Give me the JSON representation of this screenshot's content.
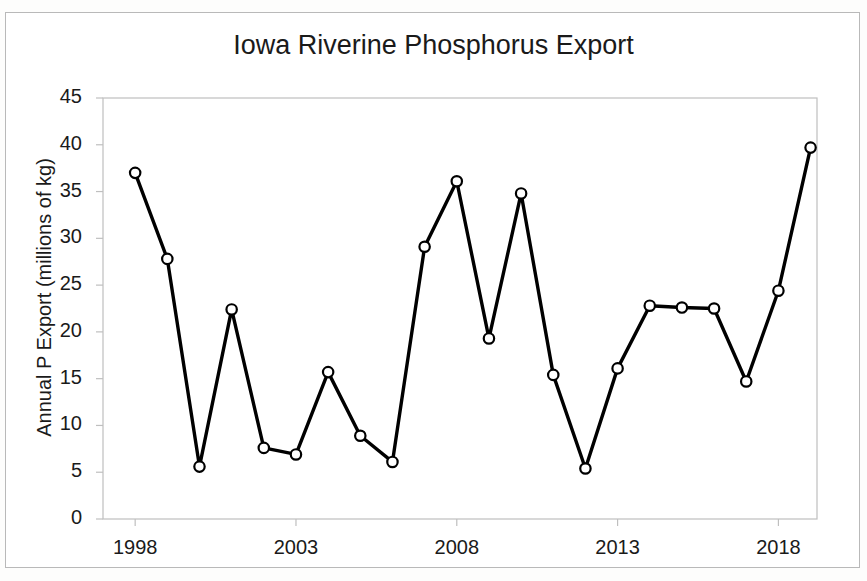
{
  "chart_data": {
    "type": "line",
    "title": "Iowa Riverine Phosphorus Export",
    "xlabel": "",
    "ylabel": "Annual P Export (millions of kg)",
    "x": [
      1998,
      1999,
      2000,
      2001,
      2002,
      2003,
      2004,
      2005,
      2006,
      2007,
      2008,
      2009,
      2010,
      2011,
      2012,
      2013,
      2014,
      2015,
      2016,
      2017,
      2018,
      2019
    ],
    "values": [
      37.0,
      27.8,
      5.6,
      22.4,
      7.6,
      6.9,
      15.7,
      8.9,
      6.1,
      29.1,
      36.1,
      19.3,
      34.8,
      15.4,
      5.4,
      16.1,
      22.8,
      22.6,
      22.5,
      14.7,
      24.4,
      39.7
    ],
    "series": [
      {
        "name": "Annual P Export",
        "values": [
          37.0,
          27.8,
          5.6,
          22.4,
          7.6,
          6.9,
          15.7,
          8.9,
          6.1,
          29.1,
          36.1,
          19.3,
          34.8,
          15.4,
          5.4,
          16.1,
          22.8,
          22.6,
          22.5,
          14.7,
          24.4,
          39.7
        ]
      }
    ],
    "ylim": [
      0,
      45
    ],
    "ytick_values": [
      0,
      5,
      10,
      15,
      20,
      25,
      30,
      35,
      40,
      45
    ],
    "ytick_labels": [
      "0",
      "5",
      "10",
      "15",
      "20",
      "25",
      "30",
      "35",
      "40",
      "45"
    ],
    "xlim": [
      1997.0,
      2019.2
    ],
    "xtick_values": [
      1998,
      2003,
      2008,
      2013,
      2018
    ],
    "xtick_labels": [
      "1998",
      "2003",
      "2008",
      "2013",
      "2018"
    ],
    "grid": false,
    "legend": null,
    "legend_position": "none",
    "marker": "open-circle",
    "line_color": "#000000",
    "marker_fill": "#ffffff",
    "axis_color": "#bfbfbf",
    "background_color": "#ffffff"
  }
}
